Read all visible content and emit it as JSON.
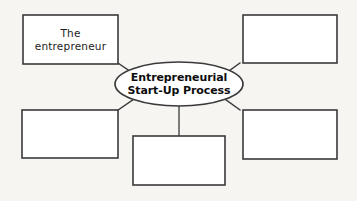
{
  "diagram": {
    "type": "concept-map",
    "center": {
      "shape": "ellipse",
      "line1": "Entrepreneurial",
      "line2": "Start-Up Process",
      "text": "Entrepreneurial Start-Up Process"
    },
    "nodes": [
      {
        "id": "top-left",
        "position": "top-left",
        "shape": "rectangle",
        "line1": "The",
        "line2": "entrepreneur",
        "text": "The entrepreneur",
        "filled": true
      },
      {
        "id": "top-right",
        "position": "top-right",
        "shape": "rectangle",
        "line1": "",
        "line2": "",
        "text": "",
        "filled": false
      },
      {
        "id": "bottom-left",
        "position": "bottom-left",
        "shape": "rectangle",
        "line1": "",
        "line2": "",
        "text": "",
        "filled": false
      },
      {
        "id": "bottom-center",
        "position": "bottom-center",
        "shape": "rectangle",
        "line1": "",
        "line2": "",
        "text": "",
        "filled": false
      },
      {
        "id": "bottom-right",
        "position": "bottom-right",
        "shape": "rectangle",
        "line1": "",
        "line2": "",
        "text": "",
        "filled": false
      }
    ],
    "connectors": [
      {
        "from": "center",
        "to": "top-left",
        "style": "diagonal"
      },
      {
        "from": "center",
        "to": "top-right",
        "style": "diagonal"
      },
      {
        "from": "center",
        "to": "bottom-left",
        "style": "diagonal"
      },
      {
        "from": "center",
        "to": "bottom-right",
        "style": "diagonal"
      },
      {
        "from": "center",
        "to": "bottom-center",
        "style": "vertical"
      }
    ],
    "colors": {
      "background": "#f6f5f2",
      "stroke": "#3a3a3a",
      "text": "#1c1c1c"
    }
  }
}
